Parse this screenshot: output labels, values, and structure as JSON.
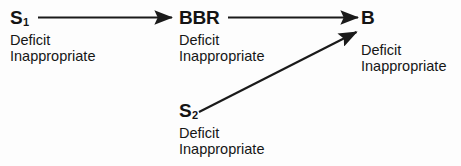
{
  "diagram": {
    "type": "flow-diagram",
    "background_color": "#fdfdfd",
    "line_color": "#1a1a1a",
    "text_color": "#141414",
    "nodes": [
      {
        "id": "s1",
        "label_main": "S",
        "label_sub": "1",
        "attributes": [
          "Deficit",
          "Inappropriate"
        ]
      },
      {
        "id": "bbr",
        "label_main": "BBR",
        "label_sub": "",
        "attributes": [
          "Deficit",
          "Inappropriate"
        ]
      },
      {
        "id": "b",
        "label_main": "B",
        "label_sub": "",
        "attributes": [
          "Deficit",
          "Inappropriate"
        ]
      },
      {
        "id": "s2",
        "label_main": "S",
        "label_sub": "2",
        "attributes": [
          "Deficit",
          "Inappropriate"
        ]
      }
    ],
    "edges": [
      {
        "id": "s1-to-bbr",
        "from": "s1",
        "to": "bbr",
        "style": "solid-arrow"
      },
      {
        "id": "bbr-to-b",
        "from": "bbr",
        "to": "b",
        "style": "solid-arrow"
      },
      {
        "id": "s2-to-b",
        "from": "s2",
        "to": "b",
        "style": "solid-arrow-diagonal"
      }
    ]
  }
}
